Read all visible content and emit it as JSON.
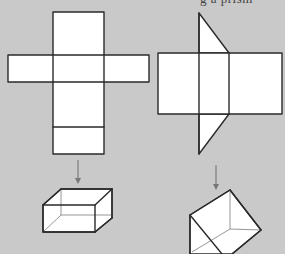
{
  "caption_fragment": "g a prism",
  "background_color": "#c9c9c9",
  "figures": [
    {
      "id": "cuboid",
      "net": {
        "label": "cuboid-net",
        "faces": 6,
        "layout": "cross"
      },
      "arrow": "down",
      "solid": {
        "label": "cuboid",
        "type": "rectangular-prism"
      }
    },
    {
      "id": "triangular-prism",
      "net": {
        "label": "triangular-prism-net",
        "faces": 5,
        "layout": "three-rectangles-two-triangles"
      },
      "arrow": "down",
      "solid": {
        "label": "triangular-prism",
        "type": "triangular-prism"
      }
    }
  ]
}
